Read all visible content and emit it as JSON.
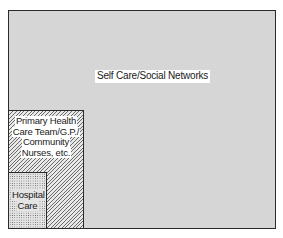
{
  "diagram": {
    "type": "nested-boxes",
    "levels": [
      {
        "id": "self-care",
        "label": "Self Care/Social Networks",
        "fill": "light grey"
      },
      {
        "id": "primary-care",
        "label_lines": [
          "Primary Health",
          "Care Team/G.P./",
          "Community",
          "Nurses, etc."
        ],
        "fill": "diagonal hatch"
      },
      {
        "id": "hospital-care",
        "label_lines": [
          "Hospital",
          "Care"
        ],
        "fill": "dotted stipple"
      }
    ]
  }
}
